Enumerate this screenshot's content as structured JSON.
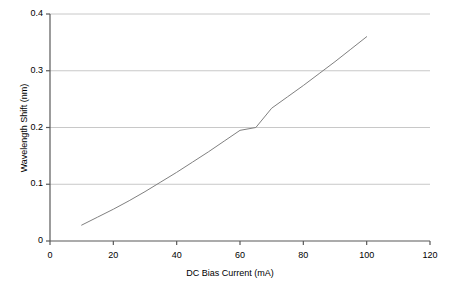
{
  "chart_data": {
    "type": "line",
    "title": "",
    "xlabel": "DC Bias Current (mA)",
    "ylabel": "Wavelength Shift (nm)",
    "xlim": [
      0,
      120
    ],
    "ylim": [
      0,
      0.4
    ],
    "xticks": [
      "0",
      "20",
      "40",
      "60",
      "80",
      "100",
      "120"
    ],
    "xtick_values": [
      0,
      20,
      40,
      60,
      80,
      100,
      120
    ],
    "yticks": [
      "0",
      "0.1",
      "0.2",
      "0.3",
      "0.4"
    ],
    "ytick_values": [
      0,
      0.1,
      0.2,
      0.3,
      0.4
    ],
    "grid": "horizontal",
    "legend": "none",
    "series": [
      {
        "name": "Wavelength Shift",
        "color": "#808080",
        "x": [
          10,
          15,
          20,
          25,
          30,
          35,
          40,
          45,
          50,
          55,
          60,
          65,
          70,
          75,
          80,
          85,
          90,
          95,
          100
        ],
        "y": [
          0.028,
          0.042,
          0.056,
          0.071,
          0.087,
          0.104,
          0.121,
          0.139,
          0.157,
          0.176,
          0.195,
          0.2,
          0.234,
          0.254,
          0.274,
          0.295,
          0.316,
          0.338,
          0.36
        ]
      }
    ],
    "colors": {
      "axis": "#595959",
      "grid": "#c8c8c8",
      "line": "#808080",
      "text": "#000000",
      "background": "#ffffff"
    }
  }
}
